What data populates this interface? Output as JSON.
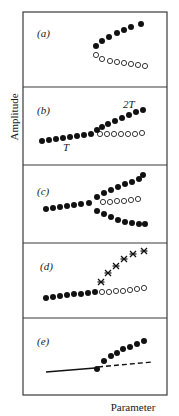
{
  "figure": {
    "ylabel": "Amplitude",
    "xlabel": "Parameter",
    "frame": {
      "x": 23,
      "y": 12,
      "width": 144,
      "height": 383
    },
    "dividers": [
      87,
      165,
      243,
      318
    ],
    "panels": [
      {
        "id": "a",
        "label": "(a)",
        "label_pos": [
          37,
          37
        ],
        "filled": [
          [
            96,
            46
          ],
          [
            102,
            41
          ],
          [
            109,
            37
          ],
          [
            117,
            33
          ],
          [
            124,
            30
          ],
          [
            131,
            27
          ],
          [
            141,
            24
          ]
        ],
        "open": [
          [
            96,
            55
          ],
          [
            102,
            59
          ],
          [
            110,
            61
          ],
          [
            117,
            62
          ],
          [
            124,
            63
          ],
          [
            131,
            64
          ],
          [
            138,
            65
          ],
          [
            145,
            66
          ]
        ],
        "stars": [],
        "annotations": []
      },
      {
        "id": "b",
        "label": "(b)",
        "label_pos": [
          37,
          114
        ],
        "filled": [
          [
            42,
            141
          ],
          [
            49,
            140
          ],
          [
            56,
            139
          ],
          [
            63,
            138
          ],
          [
            70,
            137
          ],
          [
            77,
            136
          ],
          [
            84,
            135
          ],
          [
            91,
            134
          ],
          [
            97,
            130
          ],
          [
            102,
            127
          ],
          [
            108,
            124
          ],
          [
            115,
            121
          ],
          [
            122,
            118
          ],
          [
            129,
            115
          ],
          [
            136,
            112
          ],
          [
            143,
            110
          ]
        ],
        "open": [
          [
            100,
            134
          ],
          [
            107,
            134
          ],
          [
            114,
            134
          ],
          [
            121,
            134
          ],
          [
            128,
            134
          ],
          [
            135,
            134
          ],
          [
            142,
            133
          ]
        ],
        "stars": [],
        "annotations": [
          {
            "text": "2T",
            "pos": [
              123,
              108
            ]
          },
          {
            "text": "T",
            "pos": [
              63,
              151
            ]
          }
        ]
      },
      {
        "id": "c",
        "label": "(c)",
        "label_pos": [
          37,
          195
        ],
        "filled": [
          [
            46,
            209
          ],
          [
            53,
            208
          ],
          [
            60,
            207
          ],
          [
            67,
            206
          ],
          [
            74,
            205
          ],
          [
            81,
            204
          ],
          [
            89,
            203
          ],
          [
            97,
            197
          ],
          [
            104,
            193
          ],
          [
            111,
            190
          ],
          [
            118,
            187
          ],
          [
            125,
            184
          ],
          [
            132,
            182
          ],
          [
            139,
            179
          ],
          [
            143,
            175
          ],
          [
            97,
            211
          ],
          [
            104,
            214
          ],
          [
            111,
            217
          ],
          [
            118,
            220
          ],
          [
            125,
            222
          ],
          [
            132,
            223
          ],
          [
            139,
            224
          ],
          [
            145,
            224
          ]
        ],
        "open": [
          [
            103,
            202
          ],
          [
            110,
            202
          ],
          [
            117,
            201
          ],
          [
            124,
            201
          ],
          [
            131,
            200
          ],
          [
            138,
            199
          ]
        ],
        "stars": [],
        "annotations": []
      },
      {
        "id": "d",
        "label": "(d)",
        "label_pos": [
          40,
          270
        ],
        "filled": [
          [
            46,
            298
          ],
          [
            53,
            297
          ],
          [
            60,
            296
          ],
          [
            67,
            295
          ],
          [
            74,
            294
          ],
          [
            81,
            294
          ],
          [
            88,
            293
          ],
          [
            95,
            292
          ]
        ],
        "open": [
          [
            102,
            292
          ],
          [
            109,
            292
          ],
          [
            116,
            291
          ],
          [
            123,
            291
          ],
          [
            130,
            290
          ],
          [
            137,
            289
          ],
          [
            144,
            288
          ]
        ],
        "stars": [
          [
            101,
            282
          ],
          [
            108,
            273
          ],
          [
            116,
            266
          ],
          [
            124,
            259
          ],
          [
            133,
            254
          ],
          [
            144,
            251
          ]
        ],
        "annotations": []
      },
      {
        "id": "e",
        "label": "(e)",
        "label_pos": [
          37,
          345
        ],
        "filled": [
          [
            97,
            369
          ],
          [
            104,
            361
          ],
          [
            111,
            356
          ],
          [
            117,
            353
          ],
          [
            123,
            349
          ],
          [
            130,
            347
          ],
          [
            137,
            344
          ],
          [
            144,
            341
          ]
        ],
        "open": [],
        "stars": [],
        "solid_line": [
          [
            46,
            372
          ],
          [
            95,
            368
          ]
        ],
        "dash_line": [
          [
            98,
            367
          ],
          [
            152,
            362
          ]
        ],
        "annotations": []
      }
    ]
  },
  "chart_data": {
    "type": "scatter",
    "xlabel": "Parameter",
    "ylabel": "Amplitude",
    "panels": [
      {
        "label": "(a)",
        "description": "Saddle-node: stable branch (filled) rises, unstable branch (open) falls from a fold point",
        "series": [
          {
            "name": "stable",
            "marker": "filled-circle",
            "count": 7
          },
          {
            "name": "unstable",
            "marker": "open-circle",
            "count": 8
          }
        ]
      },
      {
        "label": "(b)",
        "description": "Period-doubling: period-T branch continues as unstable (open) while 2T branch emerges (filled)",
        "annotations": [
          "T",
          "2T"
        ],
        "series": [
          {
            "name": "T stable",
            "marker": "filled-circle"
          },
          {
            "name": "2T stable",
            "marker": "filled-circle"
          },
          {
            "name": "T unstable",
            "marker": "open-circle"
          }
        ]
      },
      {
        "label": "(c)",
        "description": "Pitchfork: branch splits into two stable branches (filled, up and down) and one unstable (open)",
        "series": [
          {
            "name": "stable upper",
            "marker": "filled-circle"
          },
          {
            "name": "stable lower",
            "marker": "filled-circle"
          },
          {
            "name": "unstable middle",
            "marker": "open-circle"
          }
        ]
      },
      {
        "label": "(d)",
        "description": "Branch becomes unstable (open) and a new state marked by asterisks emerges",
        "series": [
          {
            "name": "stable",
            "marker": "filled-circle"
          },
          {
            "name": "unstable",
            "marker": "open-circle"
          },
          {
            "name": "new attractor",
            "marker": "asterisk"
          }
        ]
      },
      {
        "label": "(e)",
        "description": "Hopf-type: solid line fixed point becomes dashed (unstable), oscillation amplitude (filled) grows",
        "series": [
          {
            "name": "fixed point stable",
            "marker": "solid-line"
          },
          {
            "name": "fixed point unstable",
            "marker": "dashed-line"
          },
          {
            "name": "limit cycle amplitude",
            "marker": "filled-circle"
          }
        ]
      }
    ],
    "grid": false,
    "legend": "none"
  }
}
